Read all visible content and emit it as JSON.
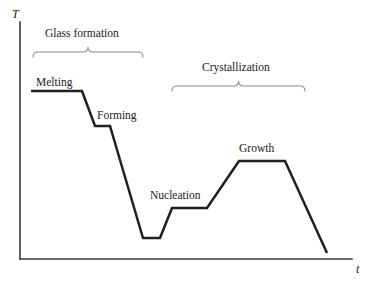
{
  "figure": {
    "background_color": "#ffffff",
    "curve_color": "#231f20",
    "axis_color": "#3a3a3c",
    "brace_color": "#8c8c8e"
  },
  "axes": {
    "y_label": "T",
    "x_label": "t",
    "y_axis": {
      "x": 20,
      "y_top": 22,
      "y_bottom": 259
    },
    "x_axis": {
      "y": 259,
      "x_left": 20,
      "x_right": 352
    }
  },
  "group_brackets": [
    {
      "label": "Glass formation",
      "label_x": 45,
      "label_y": 28,
      "x_start": 33,
      "x_end": 143,
      "y": 52
    },
    {
      "label": "Crystallization",
      "label_x": 202,
      "label_y": 62,
      "x_start": 172,
      "x_end": 305,
      "y": 86
    }
  ],
  "stage_labels": [
    {
      "name": "Melting",
      "x": 36,
      "y": 77
    },
    {
      "name": "Forming",
      "x": 97,
      "y": 110
    },
    {
      "name": "Nucleation",
      "x": 150,
      "y": 190
    },
    {
      "name": "Growth",
      "x": 239,
      "y": 143
    }
  ],
  "chart_data": {
    "type": "line",
    "title": "",
    "xlabel": "t",
    "ylabel": "T",
    "grid": false,
    "legend": "none",
    "series": [
      {
        "name": "Thermal profile",
        "points": [
          [
            31,
            91
          ],
          [
            82,
            91
          ],
          [
            95,
            126
          ],
          [
            110,
            126
          ],
          [
            143,
            238
          ],
          [
            160,
            238
          ],
          [
            172,
            208
          ],
          [
            207,
            208
          ],
          [
            239,
            161
          ],
          [
            285,
            161
          ],
          [
            327,
            253
          ]
        ]
      }
    ]
  }
}
